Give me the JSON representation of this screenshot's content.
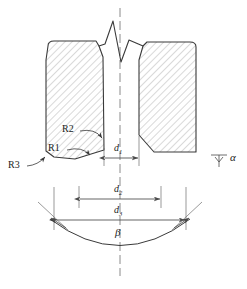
{
  "figure": {
    "kind": "engineering-cross-section-drawing",
    "stroke_color": "#3a3a3a",
    "hatch_color": "#8c8c8c",
    "centerline_color": "#8a8a8a",
    "dimension_color": "#4a4a4a",
    "background_color": "#ffffff"
  },
  "labels": {
    "r1": "R1",
    "r2": "R2",
    "r3": "R3",
    "d1_base": "d",
    "d1_sub": "1",
    "d2_base": "d",
    "d2_sub": "2",
    "d3_base": "d",
    "d3_sub": "3",
    "alpha": "α",
    "beta": "β"
  },
  "annotations": [
    {
      "name": "R1",
      "text": "R1",
      "kind": "radius-callout",
      "points_to": "lower-left-chamfer-edge"
    },
    {
      "name": "R2",
      "text": "R2",
      "kind": "radius-callout",
      "points_to": "inner-lower-cavity-edge"
    },
    {
      "name": "R3",
      "text": "R3",
      "kind": "radius-callout",
      "points_to": "outer-bottom-left-corner"
    },
    {
      "name": "d1",
      "text": "d1",
      "kind": "linear-dimension",
      "location": "throat-gap-width"
    },
    {
      "name": "d2",
      "text": "d2",
      "kind": "linear-dimension",
      "location": "mid-span-width"
    },
    {
      "name": "d3",
      "text": "d3",
      "kind": "linear-dimension",
      "location": "full-span-width"
    },
    {
      "name": "alpha",
      "text": "α",
      "kind": "angle-callout",
      "location": "right-side-draft-angle"
    },
    {
      "name": "beta",
      "text": "β",
      "kind": "angle-callout",
      "location": "bottom-arc-included-angle"
    }
  ],
  "geometry": {
    "centerline_x": 120,
    "left_die": "hatched-block-rounded-top-chamfered-bottom",
    "right_die": "hatched-block-rounded-top-chamfered-bottom",
    "top_break": "zigzag-break-line",
    "bottom_feature": "concave-arc-with-angular-dimension"
  }
}
